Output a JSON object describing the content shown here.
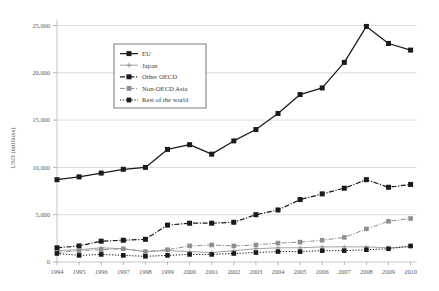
{
  "chart_data": {
    "type": "line",
    "title": "",
    "xlabel": "",
    "ylabel": "USD (millions)",
    "ylim": [
      0,
      25000
    ],
    "yticks": [
      0,
      5000,
      10000,
      15000,
      20000,
      25000
    ],
    "ytick_labels": [
      "0",
      "5,000",
      "10,000",
      "15,000",
      "20,000",
      "25,000"
    ],
    "grid": true,
    "legend_position": "upper-left-inside",
    "categories": [
      1994,
      1995,
      1996,
      1997,
      1998,
      1999,
      2000,
      2001,
      2002,
      2003,
      2004,
      2005,
      2006,
      2007,
      2008,
      2009,
      2010
    ],
    "tick_labels": [
      "1994",
      "1995",
      "1996",
      "1997",
      "1998",
      "1999",
      "2000",
      "2001",
      "2002",
      "2003",
      "2004",
      "2005",
      "2006",
      "2007",
      "2008",
      "2009",
      "2010"
    ],
    "series": [
      {
        "name": "EU",
        "style": "solid",
        "marker": "square",
        "color": "#1a1a1a",
        "values": [
          8700,
          9000,
          9400,
          9800,
          10000,
          11900,
          12400,
          11400,
          12800,
          14000,
          15700,
          17700,
          18400,
          21100,
          24900,
          23100,
          22400
        ]
      },
      {
        "name": "Japan",
        "style": "solid-thin",
        "marker": "plus",
        "color": "#8a8a8a",
        "values": [
          1200,
          1300,
          1500,
          1400,
          1100,
          1200,
          1100,
          1000,
          1200,
          1400,
          1500,
          1500,
          1600,
          1600,
          1600,
          1500,
          1600
        ]
      },
      {
        "name": "Other OECD",
        "style": "dash-dot",
        "marker": "square",
        "color": "#1a1a1a",
        "values": [
          1500,
          1700,
          2200,
          2300,
          2400,
          3900,
          4100,
          4100,
          4200,
          5000,
          5500,
          6600,
          7200,
          7800,
          8700,
          7900,
          8200
        ]
      },
      {
        "name": "Non-OECD Asia",
        "style": "dash-dot-thin",
        "marker": "square",
        "color": "#8f8f8f",
        "values": [
          1000,
          1200,
          1300,
          1400,
          1100,
          1300,
          1700,
          1800,
          1700,
          1800,
          2000,
          2100,
          2300,
          2600,
          3500,
          4300,
          4600
        ]
      },
      {
        "name": "Rest of the world",
        "style": "dotted",
        "marker": "square",
        "color": "#1a1a1a",
        "values": [
          900,
          700,
          800,
          700,
          600,
          700,
          800,
          800,
          900,
          1000,
          1100,
          1100,
          1200,
          1200,
          1300,
          1400,
          1700
        ]
      }
    ]
  },
  "axis": {
    "y_title": "USD (millions)"
  },
  "legend": {
    "items": [
      {
        "label": "EU"
      },
      {
        "label": "Japan"
      },
      {
        "label": "Other OECD"
      },
      {
        "label": "Non-OECD Asia"
      },
      {
        "label": "Rest of the world"
      }
    ]
  }
}
